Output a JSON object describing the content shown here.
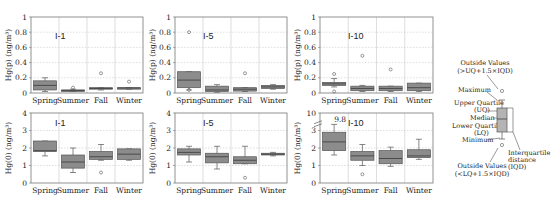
{
  "figure": {
    "row_top_ylabel": "Hg(p) (ng/m³)",
    "row_bottom_ylabel": "Hg(0) (ng/m³)"
  },
  "chart_data": [
    {
      "type": "box",
      "panel": "top-left",
      "title": "I-1",
      "ylabel": "Hg(p) (ng/m³)",
      "ylim": [
        0,
        1
      ],
      "yticks": [
        0,
        0.2,
        0.4,
        0.6,
        0.8,
        1
      ],
      "ytick_labels": [
        "0",
        "0.2",
        "0.4",
        "0.6",
        "0.8",
        "1"
      ],
      "categories": [
        "Spring",
        "Summer",
        "Fall",
        "Winter"
      ],
      "boxes": [
        {
          "min": 0.02,
          "q1": 0.04,
          "median": 0.1,
          "q3": 0.16,
          "max": 0.2,
          "outliers": []
        },
        {
          "min": 0.02,
          "q1": 0.025,
          "median": 0.035,
          "q3": 0.04,
          "max": 0.05,
          "outliers": [
            0.07
          ]
        },
        {
          "min": 0.04,
          "q1": 0.055,
          "median": 0.06,
          "q3": 0.07,
          "max": 0.07,
          "outliers": [
            0.26
          ]
        },
        {
          "min": 0.05,
          "q1": 0.06,
          "median": 0.065,
          "q3": 0.07,
          "max": 0.07,
          "outliers": [
            0.15
          ]
        }
      ],
      "grid": true
    },
    {
      "type": "box",
      "panel": "top-middle",
      "title": "I-5",
      "ylabel": "Hg(p) (ng/m³)",
      "ylim": [
        0,
        1
      ],
      "yticks": [
        0,
        0.2,
        0.4,
        0.6,
        0.8,
        1
      ],
      "ytick_labels": [
        "0",
        "0.2",
        "0.4",
        "0.6",
        "0.8",
        "1"
      ],
      "categories": [
        "Spring",
        "Summer",
        "Fall",
        "Winter"
      ],
      "boxes": [
        {
          "min": 0.04,
          "q1": 0.07,
          "median": 0.17,
          "q3": 0.28,
          "max": 0.28,
          "outliers": [
            0.8,
            0.04
          ]
        },
        {
          "min": 0.01,
          "q1": 0.02,
          "median": 0.04,
          "q3": 0.09,
          "max": 0.11,
          "outliers": []
        },
        {
          "min": 0.02,
          "q1": 0.025,
          "median": 0.05,
          "q3": 0.07,
          "max": 0.07,
          "outliers": [
            0.26
          ]
        },
        {
          "min": 0.05,
          "q1": 0.06,
          "median": 0.08,
          "q3": 0.1,
          "max": 0.11,
          "outliers": []
        }
      ],
      "grid": true
    },
    {
      "type": "box",
      "panel": "top-right",
      "title": "I-10",
      "ylabel": "Hg(p) (ng/m³)",
      "ylim": [
        0,
        1
      ],
      "yticks": [
        0,
        0.2,
        0.4,
        0.6,
        0.8,
        1
      ],
      "ytick_labels": [
        "0",
        "0.2",
        "0.4",
        "0.6",
        "0.8",
        "1"
      ],
      "categories": [
        "Spring",
        "Summer",
        "Fall",
        "Winter"
      ],
      "boxes": [
        {
          "min": 0.08,
          "q1": 0.1,
          "median": 0.12,
          "q3": 0.14,
          "max": 0.19,
          "outliers": [
            0.25,
            0.02
          ]
        },
        {
          "min": 0.02,
          "q1": 0.03,
          "median": 0.06,
          "q3": 0.09,
          "max": 0.1,
          "outliers": [
            0.49
          ]
        },
        {
          "min": 0.02,
          "q1": 0.03,
          "median": 0.06,
          "q3": 0.09,
          "max": 0.09,
          "outliers": [
            0.31
          ]
        },
        {
          "min": 0.02,
          "q1": 0.03,
          "median": 0.07,
          "q3": 0.13,
          "max": 0.13,
          "outliers": []
        }
      ],
      "grid": true
    },
    {
      "type": "box",
      "panel": "bottom-left",
      "title": "I-1",
      "ylabel": "Hg(0) (ng/m³)",
      "ylim": [
        0,
        4
      ],
      "yticks": [
        0,
        1,
        2,
        3,
        4
      ],
      "ytick_labels": [
        "0",
        "1",
        "2",
        "3",
        "4"
      ],
      "categories": [
        "Spring",
        "Summer",
        "Fall",
        "Winter"
      ],
      "boxes": [
        {
          "min": 1.55,
          "q1": 1.8,
          "median": 1.85,
          "q3": 2.4,
          "max": 2.4,
          "outliers": []
        },
        {
          "min": 0.6,
          "q1": 0.85,
          "median": 1.2,
          "q3": 1.6,
          "max": 2.0,
          "outliers": []
        },
        {
          "min": 1.3,
          "q1": 1.35,
          "median": 1.5,
          "q3": 1.8,
          "max": 2.2,
          "outliers": [
            0.6
          ]
        },
        {
          "min": 1.3,
          "q1": 1.35,
          "median": 1.65,
          "q3": 1.95,
          "max": 1.95,
          "outliers": []
        }
      ],
      "grid": true
    },
    {
      "type": "box",
      "panel": "bottom-middle",
      "title": "I-5",
      "ylabel": "Hg(0) (ng/m³)",
      "ylim": [
        0,
        4
      ],
      "yticks": [
        0,
        1,
        2,
        3,
        4
      ],
      "ytick_labels": [
        "0",
        "1",
        "2",
        "3",
        "4"
      ],
      "categories": [
        "Spring",
        "Summer",
        "Fall",
        "Winter"
      ],
      "boxes": [
        {
          "min": 1.2,
          "q1": 1.6,
          "median": 1.75,
          "q3": 1.95,
          "max": 2.1,
          "outliers": []
        },
        {
          "min": 0.8,
          "q1": 1.15,
          "median": 1.5,
          "q3": 1.7,
          "max": 2.1,
          "outliers": []
        },
        {
          "min": 1.1,
          "q1": 1.1,
          "median": 1.3,
          "q3": 1.5,
          "max": 2.1,
          "outliers": [
            0.3
          ]
        },
        {
          "min": 1.55,
          "q1": 1.6,
          "median": 1.65,
          "q3": 1.7,
          "max": 1.75,
          "outliers": []
        }
      ],
      "grid": true
    },
    {
      "type": "box",
      "panel": "bottom-right",
      "title": "I-10",
      "ylabel": "Hg(0) (ng/m³)",
      "ylim": [
        0,
        4
      ],
      "yticks": [
        0,
        1,
        2,
        3,
        4
      ],
      "ytick_labels": [
        "0",
        "1",
        "2",
        "3",
        "10"
      ],
      "axis_break": true,
      "annotation": {
        "text": "9.8",
        "category": "Spring"
      },
      "categories": [
        "Spring",
        "Summer",
        "Fall",
        "Winter"
      ],
      "boxes": [
        {
          "min": 1.6,
          "q1": 1.85,
          "median": 2.35,
          "q3": 2.9,
          "max": 3.35,
          "outliers": []
        },
        {
          "min": 1.0,
          "q1": 1.3,
          "median": 1.55,
          "q3": 1.8,
          "max": 2.2,
          "outliers": [
            0.5
          ]
        },
        {
          "min": 0.95,
          "q1": 1.1,
          "median": 1.4,
          "q3": 1.85,
          "max": 2.05,
          "outliers": []
        },
        {
          "min": 1.35,
          "q1": 1.45,
          "median": 1.55,
          "q3": 1.9,
          "max": 2.5,
          "outliers": []
        }
      ],
      "grid": true
    }
  ],
  "legend": {
    "outside_high": "Outside Values",
    "outside_high_rule": "(>UQ+1.5×IQD)",
    "maximum": "Maximum",
    "upper_quartile": "Upper Quartile",
    "upper_quartile_abbr": "(UQ)",
    "median": "Median",
    "lower_quartile": "Lower Quartile",
    "lower_quartile_abbr": "(LQ)",
    "minimum": "Minimum",
    "outside_low": "Outside Values",
    "outside_low_rule": "(<LQ+1.5×IQD)",
    "iqd_line1": "Interquartile",
    "iqd_line2": "distance",
    "iqd_line3": "(IQD)"
  },
  "colors": {
    "box_fill": "#8c8c8c",
    "box_stroke": "#555555",
    "grid": "#c8c8c8",
    "axis": "#777777",
    "legend_box_fill": "#b4b4b4"
  }
}
